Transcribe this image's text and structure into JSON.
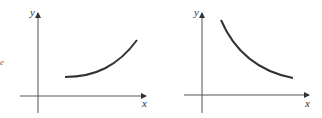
{
  "fragment_text": "e",
  "graphs": [
    {
      "id": "increasing",
      "x_label": "x",
      "y_label": "y",
      "curve": "increasing, concave up",
      "color": "#333333"
    },
    {
      "id": "decreasing",
      "x_label": "x",
      "y_label": "y",
      "curve": "decreasing, concave up",
      "color": "#333333"
    }
  ]
}
